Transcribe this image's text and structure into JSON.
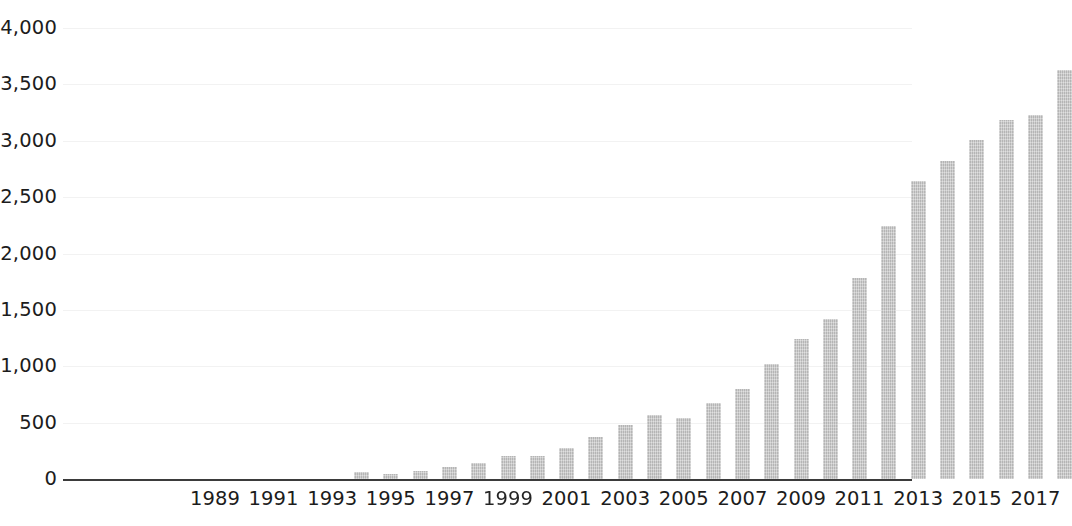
{
  "chart_data": {
    "type": "bar",
    "title": "",
    "subtitle": "",
    "xlabel": "",
    "ylabel": "",
    "grid": true,
    "legend": null,
    "bar_color": "#c6c6c6",
    "axis_color": "#3b3b3b",
    "text_color": "#1c1c1c",
    "ylim": [
      0,
      4000
    ],
    "ytick_values": [
      0,
      500,
      1000,
      1500,
      2000,
      2500,
      3000,
      3500,
      4000
    ],
    "ytick_labels": [
      "0",
      "500",
      "1,000",
      "1,500",
      "2,000",
      "2,500",
      "3,000",
      "3,500",
      "4,000"
    ],
    "xtick_labels": [
      "1989",
      "1991",
      "1993",
      "1995",
      "1997",
      "1999",
      "2001",
      "2003",
      "2005",
      "2007",
      "2009",
      "2011",
      "2013",
      "2015",
      "2017"
    ],
    "xtick_label_note": "every other category labelled; 1999 label is partially smudged in the scan",
    "categories": [
      "1989",
      "1990",
      "1991",
      "1992",
      "1993",
      "1994",
      "1995",
      "1996",
      "1997",
      "1998",
      "1999",
      "2000",
      "2001",
      "2002",
      "2003",
      "2004",
      "2005",
      "2006",
      "2007",
      "2008",
      "2009",
      "2010",
      "2011",
      "2012",
      "2013",
      "2014",
      "2015",
      "2016",
      "2017",
      "2018"
    ],
    "values": [
      0,
      0,
      0,
      0,
      0,
      60,
      45,
      75,
      105,
      140,
      200,
      200,
      275,
      370,
      475,
      565,
      545,
      675,
      800,
      1020,
      1245,
      1420,
      1780,
      2240,
      2640,
      2820,
      3010,
      3180,
      3230,
      3630
    ]
  }
}
